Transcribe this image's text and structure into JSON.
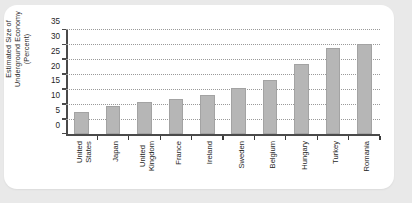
{
  "figure": {
    "background_color": "#e9e9e9",
    "card_color": "#ffffff",
    "bar_color": "#b6b6b6",
    "axis_color": "#4a4a4a"
  },
  "axis": {
    "y_title_line1": "Estimated Size of",
    "y_title_line2": "Underground Economy",
    "y_title_line3": "(Percent)",
    "y_ticks": [
      "0",
      "5",
      "10",
      "15",
      "20",
      "25",
      "30",
      "35"
    ]
  },
  "chart_data": {
    "type": "bar",
    "title": "",
    "xlabel": "",
    "ylabel": "Estimated Size of Underground Economy (Percent)",
    "ylim": [
      0,
      35
    ],
    "grid": true,
    "legend": "none",
    "orientation": "vertical",
    "categories": [
      "United States",
      "Japan",
      "United Kingdom",
      "France",
      "Ireland",
      "Sweden",
      "Belgium",
      "Hungary",
      "Turkey",
      "Romania"
    ],
    "category_lines": [
      [
        "United",
        "States"
      ],
      [
        "Japan"
      ],
      [
        "United",
        "Kingdom"
      ],
      [
        "France"
      ],
      [
        "Ireland"
      ],
      [
        "Sweden"
      ],
      [
        "Belgium"
      ],
      [
        "Hungary"
      ],
      [
        "Turkey"
      ],
      [
        "Romania"
      ]
    ],
    "values": [
      7.5,
      9.5,
      10.8,
      12.0,
      13.3,
      15.7,
      18.2,
      23.5,
      29.0,
      30.4
    ],
    "ytick_values": [
      0,
      5,
      10,
      15,
      20,
      25,
      30,
      35
    ]
  }
}
